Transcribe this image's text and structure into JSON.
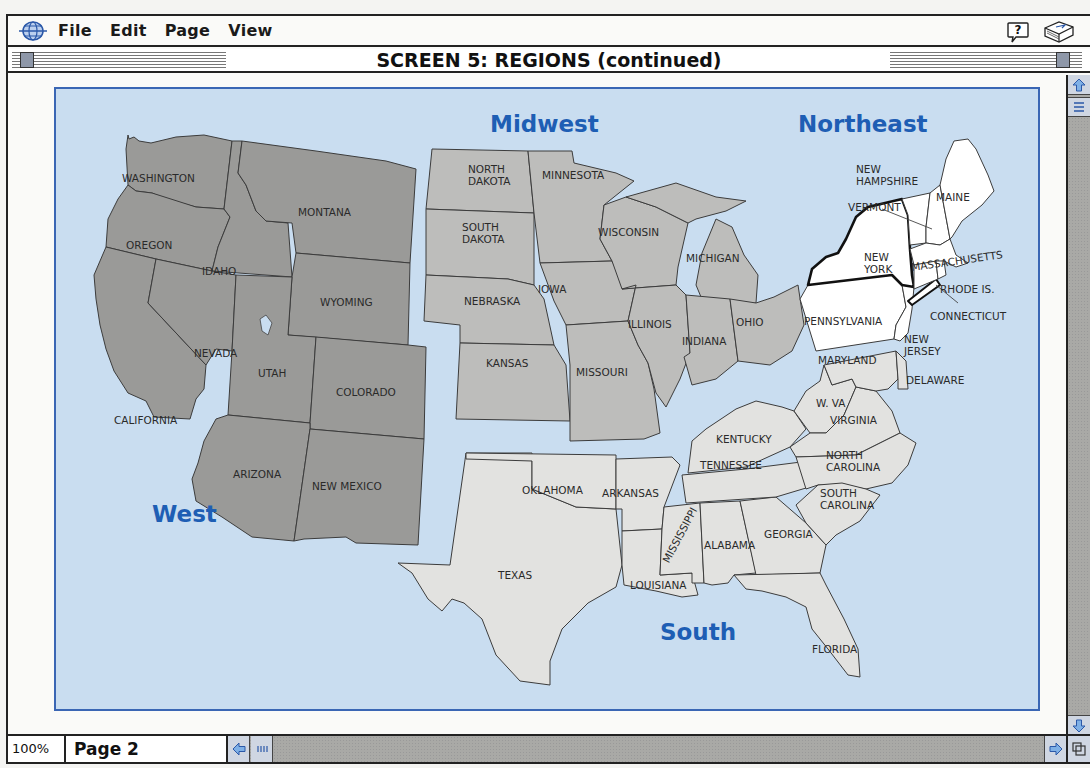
{
  "menubar": {
    "logo_icon": "globe-icon",
    "items": [
      {
        "label": "File"
      },
      {
        "label": "Edit"
      },
      {
        "label": "Page"
      },
      {
        "label": "View"
      }
    ],
    "help_icon": "help-balloon-icon",
    "book_icon": "book-icon"
  },
  "titlebar": {
    "title": "SCREEN 5: REGIONS (continued)"
  },
  "statusbar": {
    "zoom": "100%",
    "page": "Page 2"
  },
  "map": {
    "colors": {
      "water": "#c9ddf0",
      "frame": "#3a66b4",
      "west": "#9a9a98",
      "midwest": "#bdbdbb",
      "south": "#e2e2e0",
      "northeast": "#ffffff",
      "region_label": "#1e5eb4"
    },
    "regions": [
      {
        "name": "West",
        "states": [
          "Washington",
          "Oregon",
          "California",
          "Idaho",
          "Nevada",
          "Montana",
          "Wyoming",
          "Utah",
          "Colorado",
          "Arizona",
          "New Mexico"
        ]
      },
      {
        "name": "Midwest",
        "states": [
          "North Dakota",
          "South Dakota",
          "Nebraska",
          "Kansas",
          "Minnesota",
          "Iowa",
          "Missouri",
          "Wisconsin",
          "Illinois",
          "Michigan",
          "Indiana",
          "Ohio"
        ]
      },
      {
        "name": "Northeast",
        "states": [
          "Maine",
          "New Hampshire",
          "Vermont",
          "Massachusetts",
          "Rhode Is.",
          "Connecticut",
          "New York",
          "Pennsylvania",
          "New Jersey"
        ]
      },
      {
        "name": "South",
        "states": [
          "Texas",
          "Oklahoma",
          "Arkansas",
          "Louisiana",
          "Mississippi",
          "Alabama",
          "Georgia",
          "Florida",
          "Tennessee",
          "Kentucky",
          "W. Va",
          "Virginia",
          "North Carolina",
          "South Carolina",
          "Maryland",
          "Delaware"
        ]
      }
    ],
    "labels": {
      "west": "West",
      "midwest": "Midwest",
      "northeast": "Northeast",
      "south": "South",
      "washington": "WASHINGTON",
      "oregon": "OREGON",
      "california": "CALIFORNIA",
      "idaho": "IDAHO",
      "nevada": "NEVADA",
      "montana": "MONTANA",
      "wyoming": "WYOMING",
      "utah": "UTAH",
      "colorado": "COLORADO",
      "arizona": "ARIZONA",
      "new_mexico": "NEW MEXICO",
      "north_dakota_1": "NORTH",
      "north_dakota_2": "DAKOTA",
      "south_dakota_1": "SOUTH",
      "south_dakota_2": "DAKOTA",
      "nebraska": "NEBRASKA",
      "kansas": "KANSAS",
      "minnesota": "MINNESOTA",
      "iowa": "IOWA",
      "missouri": "MISSOURI",
      "wisconsin": "WISCONSIN",
      "illinois": "ILLINOIS",
      "michigan": "MICHIGAN",
      "indiana": "INDIANA",
      "ohio": "OHIO",
      "new_hampshire_1": "NEW",
      "new_hampshire_2": "HAMPSHIRE",
      "maine": "MAINE",
      "vermont": "VERMONT",
      "massachusetts": "MASSACHUSETTS",
      "new_york_1": "NEW",
      "new_york_2": "YORK",
      "rhode_island": "RHODE IS.",
      "connecticut": "CONNECTICUT",
      "pennsylvania": "PENNSYLVANIA",
      "new_jersey_1": "NEW",
      "new_jersey_2": "JERSEY",
      "maryland": "MARYLAND",
      "delaware": "DELAWARE",
      "west_virginia": "W. VA",
      "virginia": "VIRGINIA",
      "kentucky": "KENTUCKY",
      "tennessee": "TENNESSEE",
      "north_carolina_1": "NORTH",
      "north_carolina_2": "CAROLINA",
      "south_carolina_1": "SOUTH",
      "south_carolina_2": "CAROLINA",
      "oklahoma": "OKLAHOMA",
      "arkansas": "ARKANSAS",
      "texas": "TEXAS",
      "louisiana": "LOUISIANA",
      "mississippi": "MISSISSIPPI",
      "alabama": "ALABAMA",
      "georgia": "GEORGIA",
      "florida": "FLORIDA"
    }
  }
}
